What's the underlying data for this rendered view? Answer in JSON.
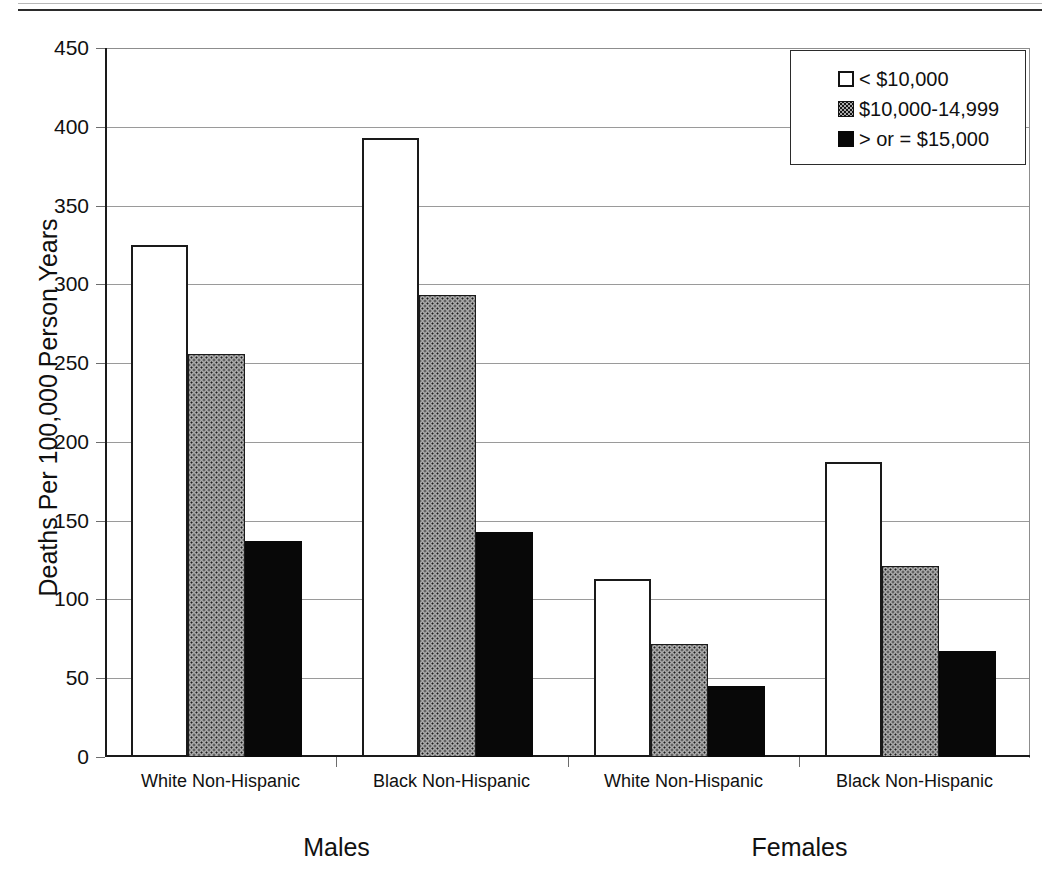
{
  "chart_data": {
    "type": "bar",
    "title": "",
    "xlabel": "",
    "ylabel": "Deaths Per 100,000 Person Years",
    "ylim": [
      0,
      450
    ],
    "ytick_labels": [
      "450",
      "400",
      "350",
      "300",
      "250",
      "200",
      "150",
      "100",
      "50",
      "0"
    ],
    "ytick_values": [
      450,
      400,
      350,
      300,
      250,
      200,
      150,
      100,
      50,
      0
    ],
    "grid": true,
    "legend_position": "top-right",
    "categories": [
      "White Non-Hispanic",
      "Black Non-Hispanic",
      "White Non-Hispanic",
      "Black Non-Hispanic"
    ],
    "supercategories": [
      {
        "label": "Males",
        "span": [
          0,
          1
        ]
      },
      {
        "label": "Females",
        "span": [
          2,
          3
        ]
      }
    ],
    "series": [
      {
        "name": "< $10,000",
        "fill": "white",
        "values": [
          325,
          393,
          113,
          187
        ]
      },
      {
        "name": "$10,000-14,999",
        "fill": "dotted-gray",
        "values": [
          256,
          293,
          72,
          121
        ]
      },
      {
        "name": "> or = $15,000",
        "fill": "black",
        "values": [
          137,
          143,
          45,
          67
        ]
      }
    ]
  },
  "axis": {
    "y_title": "Deaths Per 100,000 Person Years",
    "ticks": [
      "450",
      "400",
      "350",
      "300",
      "250",
      "200",
      "150",
      "100",
      "50",
      "0"
    ]
  },
  "legend": {
    "items": [
      {
        "label": "< $10,000",
        "swatch": "white-square-icon"
      },
      {
        "label": "$10,000-14,999",
        "swatch": "dotted-gray-square-icon"
      },
      {
        "label": "> or = $15,000",
        "swatch": "black-square-icon"
      }
    ]
  },
  "groups": [
    {
      "category": "White Non-Hispanic",
      "sex": "Males"
    },
    {
      "category": "Black Non-Hispanic",
      "sex": "Males"
    },
    {
      "category": "White Non-Hispanic",
      "sex": "Females"
    },
    {
      "category": "Black Non-Hispanic",
      "sex": "Females"
    }
  ],
  "sex_labels": [
    "Males",
    "Females"
  ],
  "colors": {
    "axis": "#1a1a1a",
    "grid": "#9a9a9a",
    "bar_white": "#ffffff",
    "bar_gray": "#a9a9a9",
    "bar_black": "#080808",
    "text": "#111111"
  }
}
